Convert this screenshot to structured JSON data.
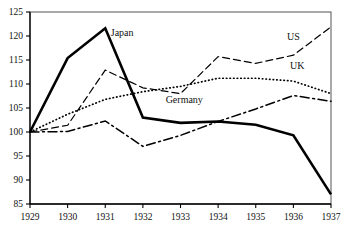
{
  "chart_data": {
    "type": "line",
    "title": "",
    "subtitle": "",
    "xlabel": "",
    "ylabel": "",
    "x": [
      1929,
      1930,
      1931,
      1932,
      1933,
      1934,
      1935,
      1936,
      1937
    ],
    "xtick_labels": [
      "1929",
      "1930",
      "1931",
      "1932",
      "1933",
      "1934",
      "1935",
      "1936",
      "1937"
    ],
    "ytick_labels": [
      "85",
      "90",
      "95",
      "100",
      "105",
      "110",
      "115",
      "120",
      "125"
    ],
    "yticks": [
      85,
      90,
      95,
      100,
      105,
      110,
      115,
      120,
      125
    ],
    "xlim": [
      1929,
      1937
    ],
    "ylim": [
      85,
      125
    ],
    "grid": false,
    "legend": "inline-annotations",
    "series": [
      {
        "name": "Japan",
        "style": "solid-thick",
        "color": "#000000",
        "label_x": 1931.45,
        "label_y": 120.0,
        "values": [
          100.0,
          115.4,
          121.6,
          103.0,
          101.9,
          102.2,
          101.5,
          99.3,
          87.0
        ]
      },
      {
        "name": "US",
        "style": "dashed",
        "color": "#000000",
        "label_x": 1936.0,
        "label_y": 119.2,
        "values": [
          100.0,
          101.4,
          112.9,
          109.2,
          108.0,
          115.7,
          114.3,
          116.0,
          121.9
        ]
      },
      {
        "name": "UK",
        "style": "dotted",
        "color": "#000000",
        "label_x": 1936.1,
        "label_y": 113.2,
        "values": [
          100.0,
          103.7,
          106.8,
          108.4,
          109.5,
          111.2,
          111.2,
          110.6,
          108.0
        ]
      },
      {
        "name": "Germany",
        "style": "dash-dot",
        "color": "#000000",
        "label_x": 1933.1,
        "label_y": 106.0,
        "values": [
          100.0,
          100.1,
          102.3,
          97.0,
          99.3,
          102.2,
          104.8,
          107.6,
          106.4
        ]
      }
    ]
  }
}
